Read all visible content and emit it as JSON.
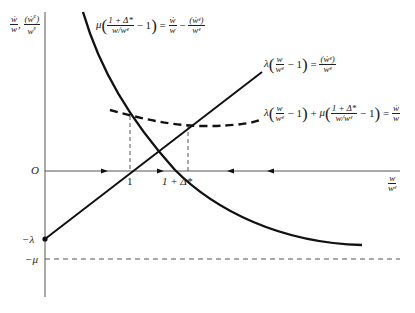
{
  "figure": {
    "type": "phase-diagram",
    "axes": {
      "y_label": {
        "parts": [
          "ẇ/w",
          ", ",
          "(ẇᵉ)/wᵉ"
        ]
      },
      "x_label": {
        "num": "w",
        "den": "wᵉ"
      },
      "origin_label": "O",
      "y_ticks": [
        {
          "label": "O",
          "value": 0
        },
        {
          "label": "−λ",
          "value": "-lambda"
        },
        {
          "label": "−μ",
          "value": "-mu"
        }
      ],
      "x_ticks": [
        {
          "label": "1"
        },
        {
          "label": "1 + Δ*"
        }
      ]
    },
    "curves": [
      {
        "name": "decreasing-curve",
        "style": "solid",
        "label": {
          "mu": "μ",
          "frac_num": "1 + Δ*",
          "frac_den": "w/wᵉ",
          "minus_one": "− 1",
          "equals": "=",
          "rhs1_num": "ẇ",
          "rhs1_den": "w",
          "minus": "−",
          "rhs2_num": "(ẇᵉ)",
          "rhs2_den": "wᵉ"
        }
      },
      {
        "name": "increasing-line",
        "style": "solid",
        "label": {
          "lambda": "λ",
          "frac_num": "w",
          "frac_den": "wᵉ",
          "minus_one": "− 1",
          "equals": "=",
          "rhs_num": "(ẇᵉ)",
          "rhs_den": "wᵉ"
        }
      },
      {
        "name": "dashed-curve",
        "style": "dashed",
        "label": {
          "lambda": "λ",
          "frac1_num": "w",
          "frac1_den": "wᵉ",
          "minus_one_a": "− 1",
          "plus": "+",
          "mu": "μ",
          "frac2_num": "1 + Δ*",
          "frac2_den": "w/wᵉ",
          "minus_one_b": "− 1",
          "equals": "=",
          "rhs_num": "ẇ",
          "rhs_den": "w"
        }
      }
    ],
    "arrows": [
      {
        "direction": "right",
        "x": 106
      },
      {
        "direction": "right",
        "x": 162
      },
      {
        "direction": "left",
        "x": 229
      },
      {
        "direction": "left",
        "x": 269
      }
    ],
    "reference_lines": [
      {
        "name": "minus-mu-asymptote",
        "style": "dashed",
        "label": "−μ"
      },
      {
        "name": "vertical-at-1",
        "style": "dashed"
      },
      {
        "name": "vertical-at-1-plus-delta",
        "style": "dashed"
      }
    ]
  }
}
